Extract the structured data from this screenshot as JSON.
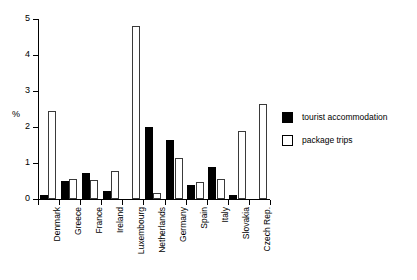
{
  "chart_data": {
    "type": "bar",
    "title": "",
    "xlabel": "",
    "ylabel": "%",
    "ylim": [
      0,
      5
    ],
    "yticks": [
      0,
      1,
      2,
      3,
      4,
      5
    ],
    "grid": false,
    "legend_position": "right",
    "categories": [
      "Denmark",
      "Greece",
      "France",
      "Ireland",
      "Luxembourg",
      "Netherlands",
      "Germany",
      "Spain",
      "Italy",
      "Slovakia",
      "Czech Rep."
    ],
    "series": [
      {
        "name": "tourist accommodation",
        "color": "#000000",
        "values": [
          0.12,
          0.5,
          0.72,
          0.22,
          0.0,
          2.0,
          1.65,
          0.38,
          0.9,
          0.1,
          0.0
        ]
      },
      {
        "name": "package trips",
        "color": "#ffffff",
        "values": [
          2.45,
          0.55,
          0.52,
          0.78,
          4.8,
          0.17,
          1.15,
          0.48,
          0.55,
          1.9,
          2.65
        ]
      }
    ]
  }
}
